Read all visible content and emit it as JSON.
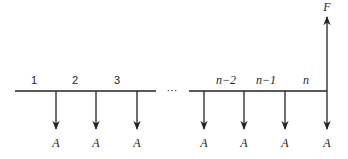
{
  "diagram": {
    "type": "cash-flow-diagram",
    "colors": {
      "stroke": "#222222",
      "background": "#ffffff"
    },
    "timeline": {
      "ellipsis": "···",
      "period_labels": [
        "1",
        "2",
        "3",
        "n−2",
        "n−1",
        "n"
      ]
    },
    "payments": {
      "label": "A",
      "count_shown": 7,
      "labels": [
        "A",
        "A",
        "A",
        "A",
        "A",
        "A",
        "A"
      ],
      "direction": "down"
    },
    "future_value": {
      "label": "F",
      "direction": "up"
    }
  }
}
